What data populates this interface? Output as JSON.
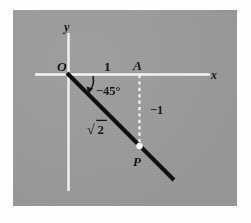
{
  "figure": {
    "kind": "cartesian-angle-diagram",
    "background_color": "#9a9a9a",
    "page_color": "#ffffff",
    "axis_color": "#f4f4f4",
    "ray_color": "#101010",
    "label_color": "#151515",
    "point_color": "#ffffff",
    "axes": {
      "x_axis_label": "x",
      "y_axis_label": "y",
      "origin_label": "O"
    },
    "labels": {
      "unit_x": "1",
      "point_a": "A",
      "angle": "−45°",
      "hypotenuse": "√2",
      "radical_symbol": "√",
      "radicand": "2",
      "drop_length": "−1",
      "point_p": "P"
    },
    "geometry": {
      "origin": [
        68,
        74
      ],
      "point_a": [
        139,
        74
      ],
      "point_p": [
        139,
        146
      ],
      "ray_end": [
        173,
        180
      ],
      "x_axis_start": [
        35,
        74
      ],
      "x_axis_end": [
        210,
        74
      ],
      "y_axis_top": [
        68,
        33
      ],
      "y_axis_bottom": [
        68,
        191
      ],
      "angle_degrees": -45,
      "hypotenuse_length": "√2",
      "leg_horizontal": 1,
      "leg_vertical": -1
    }
  }
}
